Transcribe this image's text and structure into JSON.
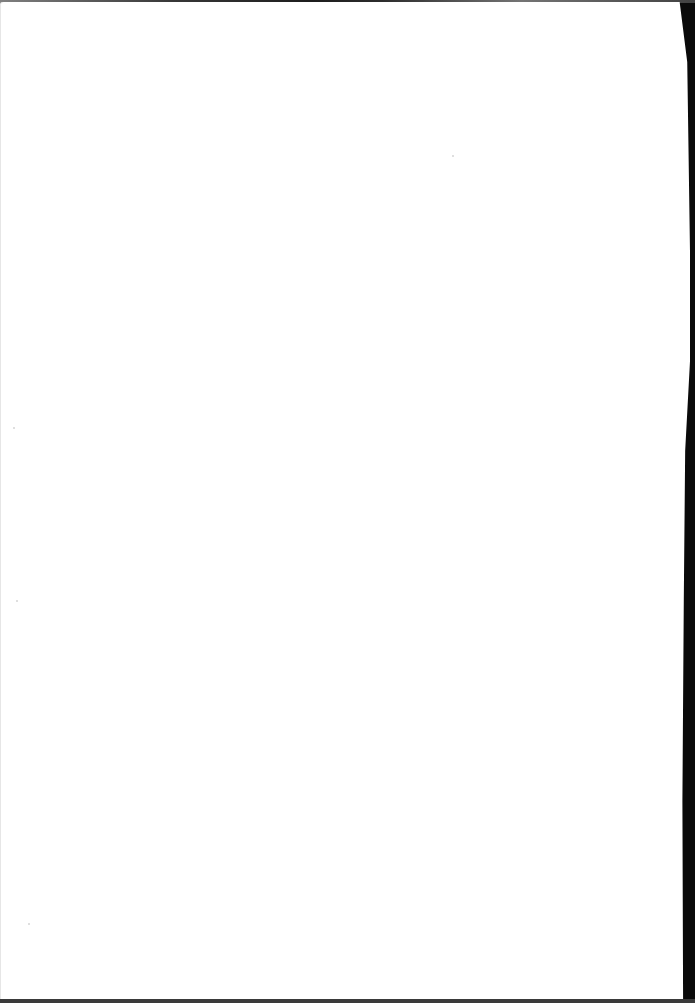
{
  "document": {
    "type": "scanned-page",
    "content": "",
    "is_blank": true
  },
  "colors": {
    "page": "#ffffff",
    "background": "#000000"
  }
}
